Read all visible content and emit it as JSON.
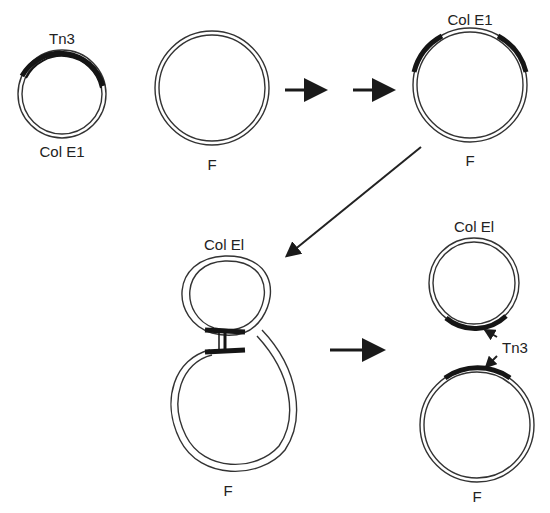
{
  "diagram": {
    "labels": {
      "tn3_top": "Tn3",
      "colE1_first": "Col E1",
      "f_first": "F",
      "colE1_cointegrate": "Col E1",
      "f_cointegrate": "F",
      "colE1_intermediate": "Col El",
      "f_intermediate": "F",
      "colE1_product": "Col El",
      "tn3_product": "Tn3",
      "f_product": "F"
    },
    "stages": [
      {
        "id": "stage-1",
        "description": "Col E1 plasmid carrying Tn3 and separate F plasmid"
      },
      {
        "id": "stage-2",
        "description": "Cointegrate of Col E1 and F with two copies of Tn3"
      },
      {
        "id": "stage-3",
        "description": "Figure-eight recombination intermediate paired at Tn3 copies"
      },
      {
        "id": "stage-4",
        "description": "Resolved Col E1 and F each carrying one Tn3"
      }
    ],
    "colors": {
      "line": "#333333",
      "transposon": "#151515",
      "background": "#ffffff"
    }
  }
}
